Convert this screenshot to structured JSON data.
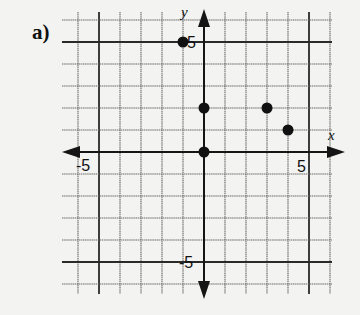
{
  "part_label": "a)",
  "axes": {
    "x_label": "x",
    "y_label": "y",
    "x_range": [
      -6,
      6
    ],
    "y_range": [
      -6,
      6
    ],
    "x_ticks_labeled": [
      {
        "value": -5,
        "label": "-5"
      },
      {
        "value": 5,
        "label": "5"
      }
    ],
    "y_ticks_labeled": [
      {
        "value": 5,
        "label": "5"
      },
      {
        "value": -5,
        "label": "-5"
      }
    ],
    "grid": true
  },
  "chart_data": {
    "type": "scatter",
    "title": "a)",
    "xlabel": "x",
    "ylabel": "y",
    "xlim": [
      -6,
      6
    ],
    "ylim": [
      -6,
      6
    ],
    "grid": true,
    "points": [
      {
        "x": -1,
        "y": 5
      },
      {
        "x": 0,
        "y": 2
      },
      {
        "x": 0,
        "y": 0
      },
      {
        "x": 3,
        "y": 2
      },
      {
        "x": 4,
        "y": 1
      }
    ]
  },
  "colors": {
    "background": "#f3f3f1",
    "grid": "#6a6a6a",
    "axis": "#151515",
    "point": "#111111"
  }
}
